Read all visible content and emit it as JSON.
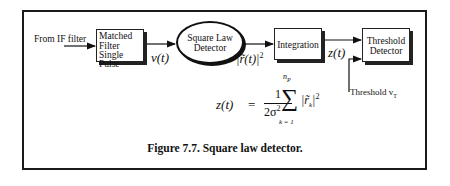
{
  "diagram": {
    "input_label": "From IF filter",
    "blocks": {
      "matched_filter": {
        "line1": "Matched",
        "line2": "Filter",
        "line3": "Single Pulse"
      },
      "square_law": {
        "line1": "Square Law",
        "line2": "Detector"
      },
      "integration": {
        "label": "Integration"
      },
      "threshold_detector": {
        "line1": "Threshold",
        "line2": "Detector"
      }
    },
    "signals": {
      "v_t": "v(t)",
      "r_squared": "|r̃(t)|",
      "r_squared_exp": "2",
      "z_t": "z(t)",
      "threshold": "Threshold v",
      "threshold_sub": "T"
    },
    "formula": {
      "lhs": "z(t)",
      "equals": "=",
      "numerator": "1",
      "denominator": "2σ",
      "denominator_exp": "2",
      "sum": "∑",
      "upper": "n",
      "upper_sub": "P",
      "lower": "k = 1",
      "term": "|r̃",
      "term_sub": "k",
      "term_close": "|",
      "term_exp": "2"
    },
    "caption": "Figure 7.7. Square law detector."
  }
}
